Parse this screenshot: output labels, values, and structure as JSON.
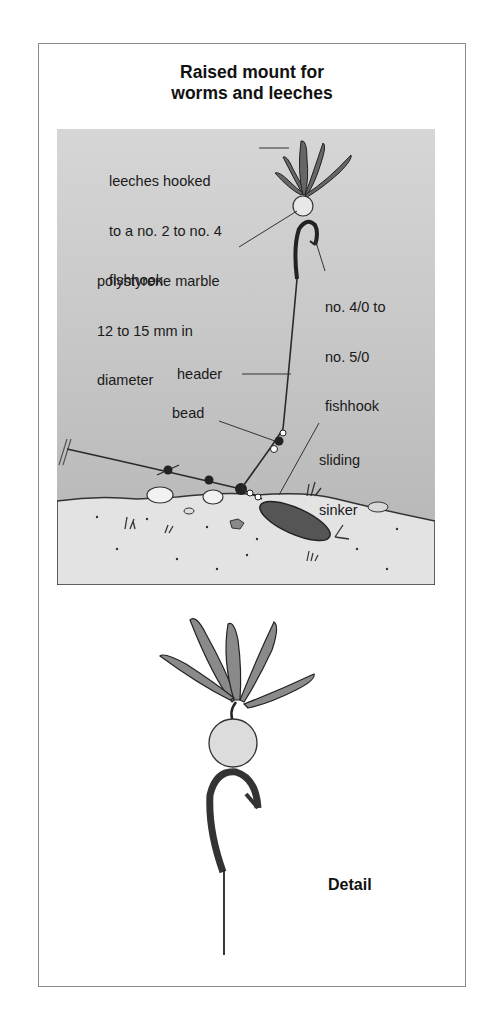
{
  "title": {
    "line1": "Raised mount for",
    "line2": "worms and leeches"
  },
  "scene": {
    "labels": {
      "leeches": [
        "leeches hooked",
        "to a no. 2 to no. 4",
        "fishhook"
      ],
      "marble": [
        "polystyrene marble",
        "12 to 15 mm in",
        "diameter"
      ],
      "hook": [
        "no. 4/0 to",
        "no. 5/0",
        "fishhook"
      ],
      "header": "header",
      "bead": "bead",
      "sinker": [
        "sliding",
        "sinker"
      ]
    },
    "colors": {
      "water_top": "#d6d6d6",
      "water_bottom": "#b4b4b4",
      "sand": "#e2e2e2",
      "line": "#2a2a2a"
    }
  },
  "detail": {
    "label": "Detail"
  }
}
